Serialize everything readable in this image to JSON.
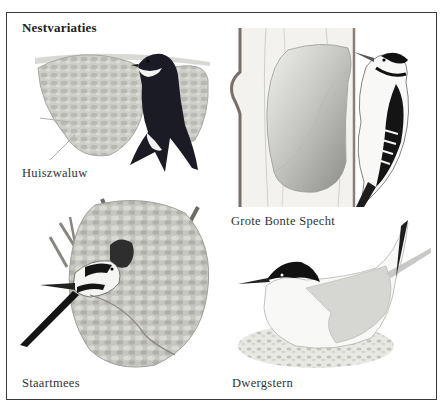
{
  "page": {
    "title": "Nestvariaties"
  },
  "panels": [
    {
      "id": "huiszwaluw",
      "label": "Huiszwaluw",
      "subject": "swallow-mud-nest"
    },
    {
      "id": "grote-bonte-specht",
      "label": "Grote Bonte Specht",
      "subject": "woodpecker-tree-hole"
    },
    {
      "id": "staartmees",
      "label": "Staartmees",
      "subject": "long-tailed-tit-dome-nest"
    },
    {
      "id": "dwergstern",
      "label": "Dwergstern",
      "subject": "little-tern-ground-nest"
    }
  ],
  "colors": {
    "frame": "#3a3a3a",
    "ink": "#1a1a22",
    "nest_grey": "#c9c9c4",
    "nest_shadow": "#8f8f8a",
    "wood": "#efeeea"
  }
}
